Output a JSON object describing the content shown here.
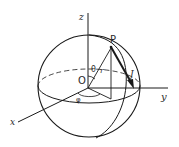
{
  "diagram": {
    "labels": {
      "z_axis": "z",
      "y_axis": "y",
      "x_axis": "x",
      "origin": "O",
      "point": "P",
      "polar_angle": "θ",
      "azimuth_angle": "φ",
      "radius": "r",
      "vector": "J"
    },
    "colors": {
      "line": "#1a1a1a",
      "background": "#ffffff"
    }
  }
}
